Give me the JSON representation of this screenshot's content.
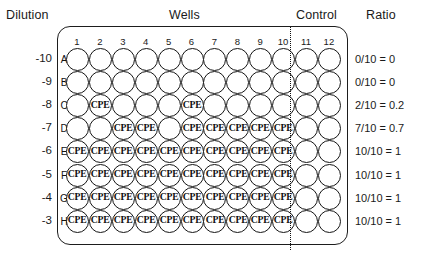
{
  "headers": {
    "dilution": "Dilution",
    "wells": "Wells",
    "control": "Control",
    "ratio": "Ratio"
  },
  "plate": {
    "column_labels": [
      "1",
      "2",
      "3",
      "4",
      "5",
      "6",
      "7",
      "8",
      "9",
      "10",
      "11",
      "12"
    ],
    "row_labels": [
      "A",
      "B",
      "C",
      "D",
      "E",
      "F",
      "G",
      "H"
    ],
    "well_marker": "CPE",
    "control_columns": [
      "11",
      "12"
    ],
    "test_columns": [
      "1",
      "2",
      "3",
      "4",
      "5",
      "6",
      "7",
      "8",
      "9",
      "10"
    ]
  },
  "rows": [
    {
      "letter": "A",
      "dilution": "-10",
      "ratio": "0/10 = 0",
      "cpe": [
        false,
        false,
        false,
        false,
        false,
        false,
        false,
        false,
        false,
        false,
        false,
        false
      ]
    },
    {
      "letter": "B",
      "dilution": "-9",
      "ratio": "0/10  = 0",
      "cpe": [
        false,
        false,
        false,
        false,
        false,
        false,
        false,
        false,
        false,
        false,
        false,
        false
      ]
    },
    {
      "letter": "C",
      "dilution": "-8",
      "ratio": "2/10  = 0.2",
      "cpe": [
        false,
        true,
        false,
        false,
        false,
        true,
        false,
        false,
        false,
        false,
        false,
        false
      ]
    },
    {
      "letter": "D",
      "dilution": "-7",
      "ratio": "7/10 = 0.7",
      "cpe": [
        false,
        false,
        true,
        true,
        false,
        true,
        true,
        true,
        true,
        true,
        false,
        false
      ]
    },
    {
      "letter": "E",
      "dilution": "-6",
      "ratio": "10/10 = 1",
      "cpe": [
        true,
        true,
        true,
        true,
        true,
        true,
        true,
        true,
        true,
        true,
        false,
        false
      ]
    },
    {
      "letter": "F",
      "dilution": "-5",
      "ratio": "10/10 = 1",
      "cpe": [
        true,
        true,
        true,
        true,
        true,
        true,
        true,
        true,
        true,
        true,
        false,
        false
      ]
    },
    {
      "letter": "G",
      "dilution": "-4",
      "ratio": "10/10 = 1",
      "cpe": [
        true,
        true,
        true,
        true,
        true,
        true,
        true,
        true,
        true,
        true,
        false,
        false
      ]
    },
    {
      "letter": "H",
      "dilution": "-3",
      "ratio": "10/10 = 1",
      "cpe": [
        true,
        true,
        true,
        true,
        true,
        true,
        true,
        true,
        true,
        true,
        false,
        false
      ]
    }
  ],
  "geometry": {
    "col_x_start": 66,
    "col_step": 22.9,
    "row_y_start": 48,
    "row_step": 23.1
  }
}
